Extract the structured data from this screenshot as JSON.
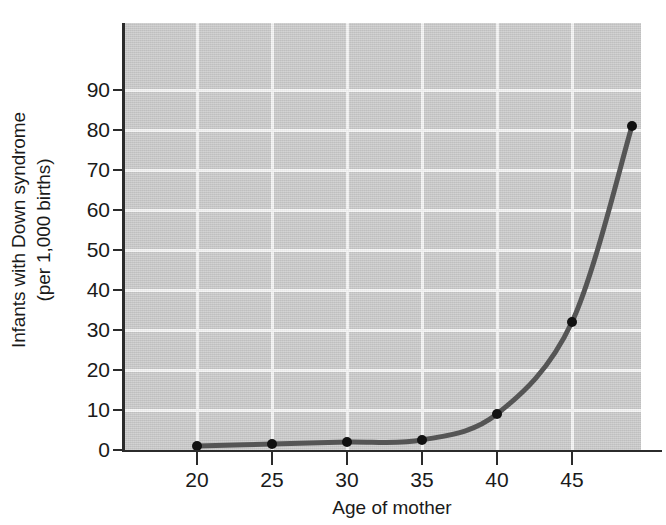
{
  "chart_data": {
    "type": "line",
    "title": "",
    "subtitle": "",
    "xlabel": "Age of mother",
    "ylabel_line1": "Infants with Down syndrome",
    "ylabel_line2": "(per 1,000 births)",
    "ylabel": "Infants with Down syndrome (per 1,000 births)",
    "x": [
      20,
      25,
      30,
      35,
      40,
      45,
      49
    ],
    "values": [
      1,
      1.5,
      2,
      2.5,
      9,
      32,
      81
    ],
    "series": [
      {
        "name": "Incidence of Down syndrome",
        "x": [
          20,
          25,
          30,
          35,
          40,
          45,
          49
        ],
        "values": [
          1,
          1.5,
          2,
          2.5,
          9,
          32,
          81
        ]
      }
    ],
    "xticks": [
      20,
      25,
      30,
      35,
      40,
      45
    ],
    "xtick_labels": [
      "20",
      "25",
      "30",
      "35",
      "40",
      "45"
    ],
    "yticks": [
      0,
      10,
      20,
      30,
      40,
      50,
      60,
      70,
      80,
      90
    ],
    "ytick_labels": [
      "0",
      "10",
      "20",
      "30",
      "40",
      "50",
      "60",
      "70",
      "80",
      "90"
    ],
    "xlim": [
      17.5,
      49.5
    ],
    "ylim": [
      0,
      106
    ],
    "grid": true,
    "legend": "none",
    "colors": {
      "plot_background": "#c9c9c9",
      "gridline": "#f4f4f4",
      "curve": "#555555",
      "marker": "#111111",
      "axis": "#2b2b2b",
      "text": "#1a1a1a",
      "page_background": "#ffffff"
    },
    "marker_radius": 5,
    "line_width": 5
  }
}
